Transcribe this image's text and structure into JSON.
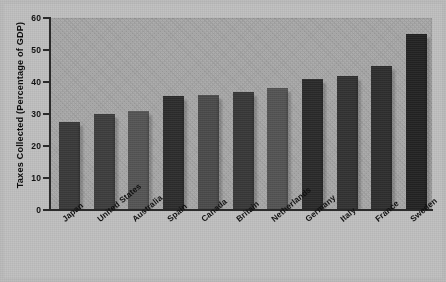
{
  "chart_data": {
    "type": "bar",
    "title": "",
    "subtitle": "",
    "xlabel": "",
    "ylabel": "Taxes Collected (Percentage of GDP)",
    "categories": [
      "Japan",
      "United States",
      "Australia",
      "Spain",
      "Canada",
      "Britain",
      "Netherlands",
      "Germany",
      "Italy",
      "France",
      "Sweden"
    ],
    "values": [
      27.5,
      30,
      31,
      35.5,
      36,
      37,
      38,
      41,
      42,
      45,
      55
    ],
    "ylim": [
      0,
      60
    ],
    "yticks": [
      0,
      10,
      20,
      30,
      40,
      50,
      60
    ],
    "ytick_labels": [
      "0",
      "10",
      "20",
      "30",
      "40",
      "50",
      "60"
    ],
    "grid": false,
    "legend": null,
    "bar_shades": [
      "#3b3b3b",
      "#3f3f3f",
      "#575757",
      "#2e2e2e",
      "#4d4d4d",
      "#3a3a3a",
      "#565656",
      "#2b2b2b",
      "#343434",
      "#303030",
      "#242424"
    ],
    "plot_background": "#a9a9a9",
    "figure_background": "#bdbdbd",
    "axis_color": "#2b2b2b"
  }
}
